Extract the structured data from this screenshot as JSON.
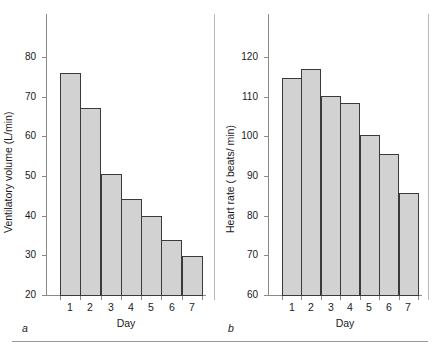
{
  "figure": {
    "background": "#ffffff",
    "bar_fill": "#d2d2d2",
    "bar_stroke": "#3a3a3a",
    "axis_color": "#8a8a8a",
    "rule_color": "#9a9a9a"
  },
  "chart_data": [
    {
      "type": "bar",
      "panel_letter": "a",
      "title": "",
      "xlabel": "Day",
      "ylabel": "Ventilatory volume (L/min)",
      "categories": [
        "1",
        "2",
        "3",
        "4",
        "5",
        "6",
        "7"
      ],
      "values": [
        76.0,
        67.1,
        50.6,
        44.3,
        40.0,
        33.9,
        29.8
      ],
      "ylim": [
        20,
        85
      ],
      "yticks": [
        20,
        30,
        40,
        50,
        60,
        70,
        80
      ],
      "ytick_labels": [
        "20",
        "30",
        "40",
        "50",
        "60",
        "70",
        "80"
      ],
      "grid": false,
      "legend": "none"
    },
    {
      "type": "bar",
      "panel_letter": "b",
      "title": "",
      "xlabel": "Day",
      "ylabel": "Heart rate ( beats/ min)",
      "categories": [
        "1",
        "2",
        "3",
        "4",
        "5",
        "6",
        "7"
      ],
      "values": [
        114.8,
        117.0,
        110.2,
        108.5,
        100.3,
        95.5,
        85.8
      ],
      "ylim": [
        60,
        125
      ],
      "yticks": [
        60,
        70,
        80,
        90,
        100,
        110,
        120
      ],
      "ytick_labels": [
        "60",
        "70",
        "80",
        "90",
        "100",
        "110",
        "120"
      ],
      "grid": false,
      "legend": "none"
    }
  ]
}
